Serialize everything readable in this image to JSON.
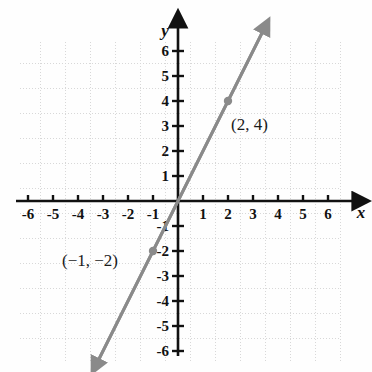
{
  "figure": {
    "kind": "coordinate-plane-line-graph",
    "background_color": "#fefefe",
    "grid_color": "#d8d8d8",
    "axis_color": "#111111",
    "line_color": "#8a8a8a",
    "point_color": "#8a8a8a"
  },
  "axes": {
    "x_label": "x",
    "y_label": "y",
    "x_ticks": [
      "-6",
      "-5",
      "-4",
      "-3",
      "-2",
      "-1",
      "1",
      "2",
      "3",
      "4",
      "5",
      "6"
    ],
    "y_ticks": [
      "6",
      "5",
      "4",
      "3",
      "2",
      "1",
      "-1",
      "-2",
      "-3",
      "-4",
      "-5",
      "-6"
    ],
    "origin_label": ""
  },
  "annotations": [
    {
      "text": "(2, 4)",
      "x": 2,
      "y": 4
    },
    {
      "text": "(−1, −2)",
      "x": -1,
      "y": -2
    }
  ],
  "chart_data": {
    "type": "line",
    "title": "",
    "xlabel": "x",
    "ylabel": "y",
    "xlim": [
      -7,
      7
    ],
    "ylim": [
      -7,
      7
    ],
    "grid": true,
    "legend": "none",
    "x_ticks": [
      -6,
      -5,
      -4,
      -3,
      -2,
      -1,
      1,
      2,
      3,
      4,
      5,
      6
    ],
    "y_ticks": [
      6,
      5,
      4,
      3,
      2,
      1,
      -1,
      -2,
      -3,
      -4,
      -5,
      -6
    ],
    "series": [
      {
        "name": "line through (-1,-2) and (2,4)",
        "slope": 2,
        "intercept": 0,
        "equation": "y = 2x",
        "arrow_start": true,
        "arrow_end": true,
        "x": [
          -3.2,
          3.4
        ],
        "values": [
          -6.4,
          6.8
        ],
        "marked_points": [
          {
            "x": -1,
            "y": -2,
            "label": "(−1, −2)"
          },
          {
            "x": 2,
            "y": 4,
            "label": "(2, 4)"
          }
        ]
      }
    ]
  }
}
